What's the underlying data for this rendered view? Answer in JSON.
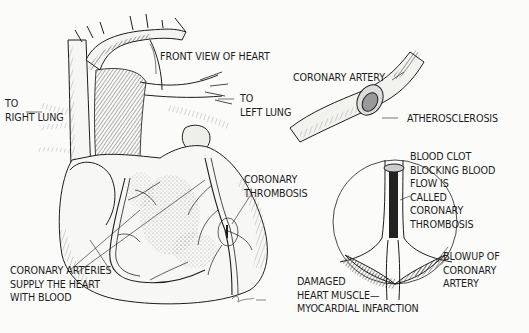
{
  "diagram": {
    "title": "FRONT VIEW OF HEART",
    "labels": {
      "front_view": [
        "FRONT VIEW OF HEART"
      ],
      "right_lung": [
        "TO",
        "RIGHT LUNG"
      ],
      "left_lung": [
        "TO",
        "LEFT LUNG"
      ],
      "coronary_artery": [
        "CORONARY ARTERY"
      ],
      "atherosclerosis": [
        "ATHEROSCLEROSIS"
      ],
      "coronary_thrombosis": [
        "CORONARY",
        "THROMBOSIS"
      ],
      "blood_clot": [
        "BLOOD CLOT",
        "BLOCKING BLOOD",
        "FLOW IS",
        "CALLED",
        "CORONARY",
        "THROMBOSIS"
      ],
      "coronary_arteries_supply": [
        "CORONARY ARTERIES",
        "SUPPLY THE HEART",
        "WITH BLOOD"
      ],
      "blowup": [
        "BLOWUP OF",
        "CORONARY",
        "ARTERY"
      ],
      "damaged_muscle": [
        "DAMAGED",
        "HEART MUSCLE—",
        "MYOCARDIAL INFARCTION"
      ]
    },
    "signature": "J. Cohen",
    "colors": {
      "ink": "#1d1d1d",
      "paper": "#fbfbfa",
      "shade": "#555555"
    }
  }
}
